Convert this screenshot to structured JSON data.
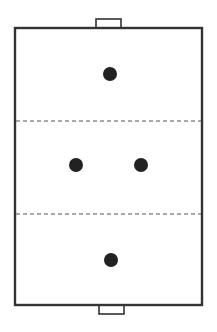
{
  "diagram": {
    "type": "sports-field-formation",
    "colors": {
      "background": "#ffffff",
      "line": "#333333",
      "dash": "#555555",
      "player": "#222222"
    },
    "field": {
      "x": 15,
      "y": 28,
      "width": 187,
      "height": 277
    },
    "goals": [
      {
        "name": "top-goal",
        "x": 96,
        "y": 19,
        "width": 25,
        "height": 9
      },
      {
        "name": "bottom-goal",
        "x": 99,
        "y": 305,
        "width": 25,
        "height": 9
      }
    ],
    "zone_lines": [
      {
        "name": "upper-zone-line",
        "y": 121
      },
      {
        "name": "lower-zone-line",
        "y": 214
      }
    ],
    "zones": [
      "top-third",
      "middle-third",
      "bottom-third"
    ],
    "players": [
      {
        "name": "player-top",
        "cx": 110,
        "cy": 74,
        "r": 7
      },
      {
        "name": "player-middle-left",
        "cx": 76,
        "cy": 165,
        "r": 7
      },
      {
        "name": "player-middle-right",
        "cx": 141,
        "cy": 165,
        "r": 7
      },
      {
        "name": "player-bottom",
        "cx": 111,
        "cy": 260,
        "r": 7
      }
    ]
  }
}
